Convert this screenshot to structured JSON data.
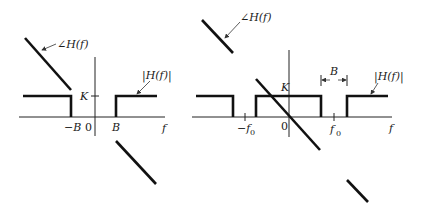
{
  "diagrams": [
    {
      "id": "lowpass",
      "labels": {
        "phase": "∠H(f)",
        "magnitude": "|H(f)|",
        "gain": "K",
        "neg_band": "−B",
        "origin": "0",
        "pos_band": "B",
        "axis": "f"
      }
    },
    {
      "id": "bandpass",
      "labels": {
        "phase": "∠H(f)",
        "magnitude": "|H(f)|",
        "gain": "K",
        "bandwidth": "B",
        "neg_center": "−f",
        "neg_center_sub": "0",
        "origin": "0",
        "pos_center": "f",
        "pos_center_sub": "0",
        "axis": "f"
      }
    }
  ],
  "colors": {
    "stroke": "#111111",
    "background": "#ffffff"
  }
}
